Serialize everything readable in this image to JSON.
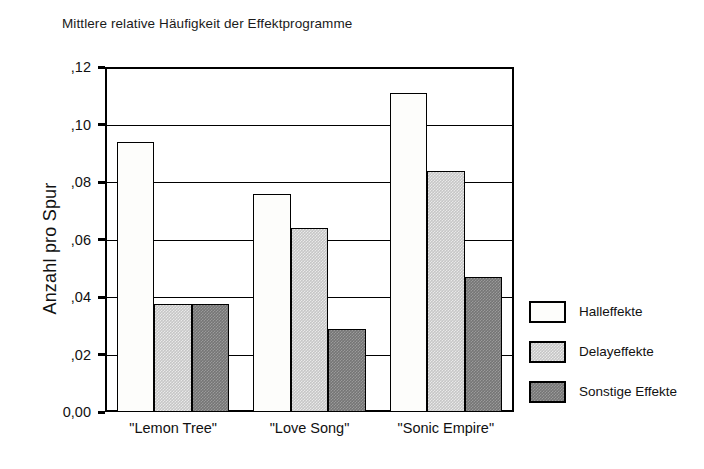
{
  "chart_data": {
    "type": "bar",
    "title": "Mittlere relative Häufigkeit der Effektprogramme",
    "xlabel": "",
    "ylabel": "Anzahl pro Spur",
    "categories": [
      "\"Lemon Tree\"",
      "\"Love Song\"",
      "\"Sonic Empire\""
    ],
    "series": [
      {
        "name": "Halleffekte",
        "values": [
          0.094,
          0.076,
          0.111
        ]
      },
      {
        "name": "Delayeffekte",
        "values": [
          0.0375,
          0.064,
          0.084
        ]
      },
      {
        "name": "Sonstige Effekte",
        "values": [
          0.0375,
          0.029,
          0.047
        ]
      }
    ],
    "ylim": [
      0.0,
      0.12
    ],
    "ytick_values": [
      0.0,
      0.02,
      0.04,
      0.06,
      0.08,
      0.1,
      0.12
    ],
    "ytick_labels": [
      "0,00",
      ",02",
      ",04",
      ",06",
      ",08",
      ",10",
      ",12"
    ],
    "grid": true,
    "legend_position": "right",
    "colors": {
      "series_0": "#fdfdfb",
      "series_1": "#c6c6c6",
      "series_2": "#757575",
      "axis": "#000000",
      "text": "#111111",
      "background": "#ffffff"
    }
  },
  "legend": {
    "entries": [
      {
        "label": "Halleffekte"
      },
      {
        "label": "Delayeffekte"
      },
      {
        "label": "Sonstige Effekte"
      }
    ]
  }
}
